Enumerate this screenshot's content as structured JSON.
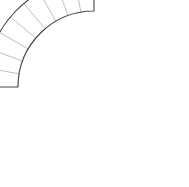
{
  "figure": {
    "kind": "geometric-line-drawing",
    "canvas": {
      "width": 189,
      "height": 187
    },
    "background_color": "#ffffff"
  },
  "geometry": {
    "shape": "annular-sector",
    "center": {
      "x": 94,
      "y": 87
    },
    "inner_radius": 76,
    "outer_radius": 109,
    "start_angle_deg": 180,
    "end_angle_deg": 270,
    "sweep_deg": 90,
    "tread_count": 9,
    "divider_count": 8,
    "divider_angles_deg": [
      190,
      200,
      210,
      220,
      230,
      240,
      250,
      260
    ],
    "corners": {
      "inner_start": {
        "x": 18,
        "y": 87
      },
      "outer_start": {
        "x": 19,
        "y": 170
      },
      "inner_end": {
        "x": 94,
        "y": 11
      },
      "outer_end": {
        "x": 172,
        "y": 11
      }
    }
  },
  "style": {
    "outline_color": "#444444",
    "outline_width": 1.1,
    "divider_color": "#b8b8b8",
    "divider_width": 0.9,
    "face_fill": "#ffffff"
  },
  "paths": {
    "outline": "M 18 87 A 76 76 0 0 1 94 11 L 172 11 A 109 109 0 0 1 19 170 Z",
    "dividers": [
      "M 19.2 100.2 L 12.6 194.7",
      "M 22.8 113 L 7.6 200.9",
      "M 28.8 125 L 0.9 205.7",
      "M 36.8 135.8 L -6.9 208.9",
      "M 46.9 145 L -16.1 210.4",
      "M 58.4 152.3 L -26.2 210.1",
      "M 71.2 157.4 L -36.7 208.2",
      "M 84.8 160.2 L -47.3 204.5"
    ]
  },
  "labels": {
    "none_visible": ""
  }
}
